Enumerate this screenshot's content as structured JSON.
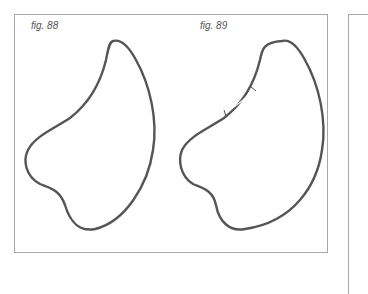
{
  "figures": [
    {
      "label": "fig. 88"
    },
    {
      "label": "fig. 89"
    }
  ],
  "colors": {
    "frame": "#a8a8a8",
    "stroke": "#555555"
  }
}
